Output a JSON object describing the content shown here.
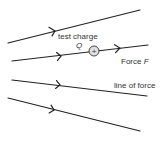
{
  "diagram": {
    "labels": {
      "test_charge": "test charge",
      "charge_symbol": "Q",
      "force_prefix": "Force ",
      "force_symbol": "F",
      "line_of_force": "line of force",
      "plus": "+"
    },
    "lines": [
      {
        "name": "field-line-1",
        "from": [
          8,
          43
        ],
        "to": [
          140,
          10
        ]
      },
      {
        "name": "field-line-2",
        "from": [
          12,
          61
        ],
        "to": [
          148,
          45
        ]
      },
      {
        "name": "field-line-3",
        "from": [
          12,
          80
        ],
        "to": [
          147,
          96
        ]
      },
      {
        "name": "field-line-4",
        "from": [
          8,
          98
        ],
        "to": [
          140,
          131
        ]
      }
    ],
    "colors": {
      "line": "#222222",
      "text": "#333333",
      "charge_fill": "#e0e0e0"
    }
  }
}
